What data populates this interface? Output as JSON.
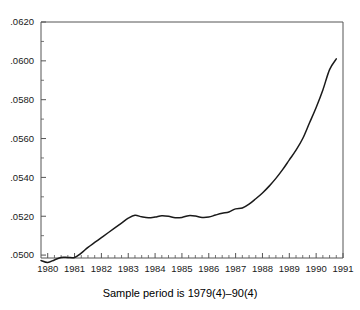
{
  "chart_data": {
    "type": "line",
    "title": "",
    "subtitle": "",
    "caption": "Sample period is 1979(4)–90(4)",
    "xlabel": "",
    "ylabel": "",
    "xlim": [
      1979.75,
      1991.0
    ],
    "ylim": [
      0.04985,
      0.062
    ],
    "grid": false,
    "legend": null,
    "legend_position": "none",
    "line_color": "#1a1a1a",
    "line_width": 1.5,
    "axis_color": "#555555",
    "xticks": [
      1980,
      1981,
      1982,
      1983,
      1984,
      1985,
      1986,
      1987,
      1988,
      1989,
      1990,
      1991
    ],
    "xtick_labels": [
      "1980",
      "1981",
      "1982",
      "1983",
      "1984",
      "1985",
      "1986",
      "1987",
      "1988",
      "1989",
      "1990",
      "1991"
    ],
    "x_minor_ticks_per_interval": 4,
    "yticks": [
      0.05,
      0.052,
      0.054,
      0.056,
      0.058,
      0.06,
      0.062
    ],
    "ytick_labels": [
      ".0500",
      ".0520",
      ".0540",
      ".0560",
      ".0580",
      ".0600",
      ".0620"
    ],
    "y_minor_ticks_per_interval": 2,
    "series": [
      {
        "name": "series-1",
        "x": [
          1979.75,
          1980.0,
          1980.25,
          1980.5,
          1980.75,
          1981.0,
          1981.25,
          1981.5,
          1981.75,
          1982.0,
          1982.25,
          1982.5,
          1982.75,
          1983.0,
          1983.25,
          1983.5,
          1983.75,
          1984.0,
          1984.25,
          1984.5,
          1984.75,
          1985.0,
          1985.25,
          1985.5,
          1985.75,
          1986.0,
          1986.25,
          1986.5,
          1986.75,
          1987.0,
          1987.25,
          1987.5,
          1987.75,
          1988.0,
          1988.25,
          1988.5,
          1988.75,
          1989.0,
          1989.25,
          1989.5,
          1989.75,
          1990.0,
          1990.25,
          1990.5,
          1990.75
        ],
        "values": [
          0.04972,
          0.04962,
          0.04975,
          0.04988,
          0.04988,
          0.04988,
          0.0501,
          0.0504,
          0.05065,
          0.0509,
          0.05115,
          0.0514,
          0.05165,
          0.0519,
          0.05205,
          0.05197,
          0.05192,
          0.05196,
          0.05203,
          0.052,
          0.05192,
          0.05194,
          0.05203,
          0.05201,
          0.05194,
          0.05196,
          0.05206,
          0.05215,
          0.05222,
          0.05238,
          0.05242,
          0.05262,
          0.0529,
          0.0532,
          0.05355,
          0.05395,
          0.0544,
          0.0549,
          0.0554,
          0.056,
          0.0568,
          0.0576,
          0.0585,
          0.05955,
          0.0601
        ]
      }
    ]
  }
}
